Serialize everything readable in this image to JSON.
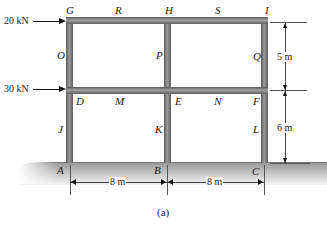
{
  "figure": {
    "caption": "(a)",
    "loads": [
      {
        "label": "20 kN",
        "at_joint": "G"
      },
      {
        "label": "30 kN",
        "at_joint": "D"
      }
    ],
    "joints": {
      "G": "G",
      "R": "R",
      "H": "H",
      "S": "S",
      "I": "I",
      "O": "O",
      "P": "P",
      "Q": "Q",
      "D": "D",
      "M": "M",
      "E": "E",
      "N": "N",
      "F": "F",
      "J": "J",
      "K": "K",
      "L": "L",
      "A": "A",
      "B": "B",
      "C": "C"
    },
    "dimensions": {
      "upper_story": "5 m",
      "lower_story": "6 m",
      "bay_left": "8 m",
      "bay_right": "8 m"
    },
    "colors": {
      "member_dark": "#5a5a5a",
      "member_light": "#a0a0a0",
      "ground": "#b0b0b0"
    }
  }
}
